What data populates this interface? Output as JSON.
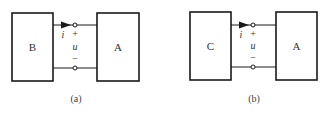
{
  "figures": [
    {
      "id": "a",
      "left_box_label": "B",
      "right_box_label": "A",
      "current_label": "i",
      "voltage_label": "u",
      "plus_sign": "+",
      "minus_sign": "−",
      "caption": "(a)"
    },
    {
      "id": "b",
      "left_box_label": "C",
      "right_box_label": "A",
      "current_label": "i",
      "voltage_label": "u",
      "plus_sign": "+",
      "minus_sign": "−",
      "caption": "(b)"
    }
  ]
}
